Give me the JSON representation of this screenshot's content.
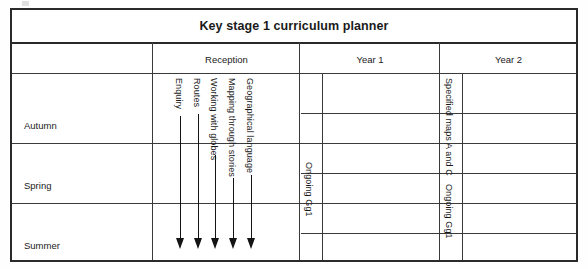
{
  "document": {
    "title": "Key stage 1 curriculum planner"
  },
  "table": {
    "column_headers": [
      {
        "label": "",
        "name": "term-column-header"
      },
      {
        "label": "Reception",
        "name": "reception-column-header"
      },
      {
        "label": "Year 1",
        "name": "year-1-column-header"
      },
      {
        "label": "Year 2",
        "name": "year-2-column-header"
      }
    ],
    "row_headers": [
      {
        "label": "Autumn",
        "name": "autumn-row-header"
      },
      {
        "label": "Spring",
        "name": "spring-row-header"
      },
      {
        "label": "Summer",
        "name": "summer-row-header"
      }
    ],
    "reception_strands": [
      {
        "label": "Enquiry"
      },
      {
        "label": "Routes"
      },
      {
        "label": "Working with globes"
      },
      {
        "label": "Mapping through stories"
      },
      {
        "label": "Geographical language"
      }
    ],
    "vertical_notes": [
      {
        "label": "Ongoing Gg1",
        "name": "reception-ongoing-note"
      },
      {
        "label": "Specified maps A and C",
        "name": "year1-specified-maps-note"
      },
      {
        "label": "Ongoing Gg1",
        "name": "year1-ongoing-note"
      }
    ]
  },
  "style": {
    "border_color": "#2a2a2a",
    "grid_color": "#3a3a3a",
    "arrow_color": "#141414",
    "text_color": "#1a1a1a",
    "page_background": "#ffffff"
  }
}
